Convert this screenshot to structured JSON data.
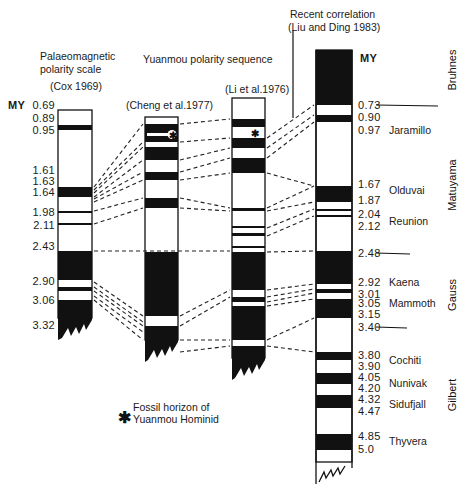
{
  "titles": {
    "palaeomagnetic_line1": "Palaeomagnetic",
    "palaeomagnetic_line2": "polarity scale",
    "cox": "(Cox 1969)",
    "yuanmou": "Yuanmou polarity sequence",
    "cheng": "(Cheng et al.1977)",
    "li": "(Li et al.1976)",
    "recent_line1": "Recent correlation",
    "recent_line2": "(Liu and Ding 1983)"
  },
  "units": {
    "left": "MY",
    "right": "MY"
  },
  "cox_ticks": [
    {
      "label": "0.69",
      "y": 105
    },
    {
      "label": "0.89",
      "y": 118
    },
    {
      "label": "0.95",
      "y": 130
    },
    {
      "label": "1.61",
      "y": 170
    },
    {
      "label": "1.63",
      "y": 181
    },
    {
      "label": "1.64",
      "y": 192
    },
    {
      "label": "1.98",
      "y": 212
    },
    {
      "label": "2.11",
      "y": 225
    },
    {
      "label": "2.43",
      "y": 246
    },
    {
      "label": "2.90",
      "y": 281
    },
    {
      "label": "3.06",
      "y": 300
    },
    {
      "label": "3.32",
      "y": 325
    }
  ],
  "liu_ticks": [
    {
      "label": "0.73",
      "y": 105
    },
    {
      "label": "0.90",
      "y": 117
    },
    {
      "label": "0.97",
      "y": 130
    },
    {
      "label": "1.67",
      "y": 184
    },
    {
      "label": "1.87",
      "y": 200
    },
    {
      "label": "2.04",
      "y": 214
    },
    {
      "label": "2.12",
      "y": 226
    },
    {
      "label": "2.48",
      "y": 253
    },
    {
      "label": "2.92",
      "y": 282
    },
    {
      "label": "3.01",
      "y": 294
    },
    {
      "label": "3.05",
      "y": 303
    },
    {
      "label": "3.15",
      "y": 314
    },
    {
      "label": "3.40",
      "y": 327
    },
    {
      "label": "3.80",
      "y": 355
    },
    {
      "label": "3.90",
      "y": 366
    },
    {
      "label": "4.05",
      "y": 377
    },
    {
      "label": "4.20",
      "y": 388
    },
    {
      "label": "4.32",
      "y": 399
    },
    {
      "label": "4.47",
      "y": 411
    },
    {
      "label": "4.85",
      "y": 436
    },
    {
      "label": "5.0",
      "y": 449
    }
  ],
  "events": [
    {
      "label": "Jaramillo",
      "y": 130
    },
    {
      "label": "Olduvai",
      "y": 190
    },
    {
      "label": "Reunion",
      "y": 221
    },
    {
      "label": "Kaena",
      "y": 282
    },
    {
      "label": "Mammoth",
      "y": 303
    },
    {
      "label": "Cochiti",
      "y": 360
    },
    {
      "label": "Nunivak",
      "y": 383
    },
    {
      "label": "Sidufjall",
      "y": 404
    },
    {
      "label": "Thyvera",
      "y": 441
    }
  ],
  "epochs": [
    {
      "label": "Bruhnes",
      "y": 70
    },
    {
      "label": "Matuyama",
      "y": 185
    },
    {
      "label": "Gauss",
      "y": 295
    },
    {
      "label": "Gilbert",
      "y": 395
    }
  ],
  "legend": {
    "symbol": "✱",
    "line1": "Fossil horizon of",
    "line2": "Yuanmou Hominid"
  },
  "columns": {
    "cox": {
      "x": 58,
      "w": 34,
      "top": 110,
      "bottom": 318,
      "black": [
        [
          125,
          130
        ],
        [
          187,
          197
        ],
        [
          211,
          213
        ],
        [
          223,
          225
        ],
        [
          251,
          280
        ],
        [
          287,
          291
        ],
        [
          300,
          318
        ]
      ]
    },
    "cheng": {
      "x": 145,
      "w": 33,
      "top": 117,
      "bottom": 340,
      "black": [
        [
          124,
          142
        ],
        [
          147,
          160
        ],
        [
          172,
          180
        ],
        [
          198,
          208
        ],
        [
          252,
          316
        ],
        [
          326,
          340
        ]
      ]
    },
    "li": {
      "x": 232,
      "w": 33,
      "top": 98,
      "bottom": 358,
      "black": [
        [
          119,
          127
        ],
        [
          138,
          148
        ],
        [
          158,
          173
        ],
        [
          208,
          211
        ],
        [
          226,
          228
        ],
        [
          233,
          236
        ],
        [
          246,
          248
        ],
        [
          252,
          290
        ],
        [
          297,
          302
        ],
        [
          306,
          340
        ],
        [
          346,
          358
        ]
      ]
    },
    "liu": {
      "x": 316,
      "w": 36,
      "top": 50,
      "bottom": 462,
      "black": [
        [
          50,
          105
        ],
        [
          115,
          122
        ],
        [
          186,
          202
        ],
        [
          209,
          211
        ],
        [
          215,
          217
        ],
        [
          251,
          284
        ],
        [
          289,
          293
        ],
        [
          299,
          318
        ],
        [
          352,
          360
        ],
        [
          373,
          384
        ],
        [
          395,
          408
        ],
        [
          434,
          450
        ]
      ]
    }
  }
}
